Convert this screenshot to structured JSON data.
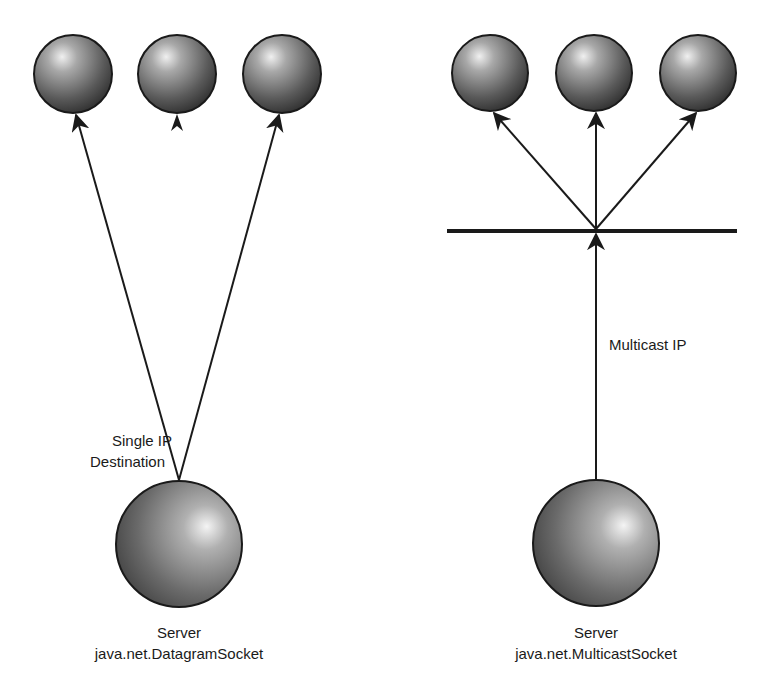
{
  "diagram": {
    "type": "network-comparison",
    "colors": {
      "background": "#ffffff",
      "stroke": "#1a1a1a",
      "sphere_light": "#f2f2f2",
      "sphere_mid": "#8a8a8a",
      "sphere_dark": "#3a3a3a"
    },
    "left": {
      "title": "Unicast",
      "clients": [
        {
          "id": "client-1",
          "cx": 73,
          "cy": 74,
          "r": 39,
          "arrow": "line"
        },
        {
          "id": "client-2",
          "cx": 177,
          "cy": 74,
          "r": 39,
          "arrow": "head-only"
        },
        {
          "id": "client-3",
          "cx": 282,
          "cy": 74,
          "r": 39,
          "arrow": "line"
        }
      ],
      "server": {
        "cx": 179,
        "cy": 544,
        "r": 63
      },
      "edge_label_line1": "Single IP",
      "edge_label_line2": "Destination",
      "server_label": "Server",
      "server_class": "java.net.DatagramSocket"
    },
    "right": {
      "title": "Multicast",
      "clients": [
        {
          "id": "client-4",
          "cx": 490,
          "cy": 73,
          "r": 38
        },
        {
          "id": "client-5",
          "cx": 594,
          "cy": 73,
          "r": 38
        },
        {
          "id": "client-6",
          "cx": 698,
          "cy": 73,
          "r": 38
        }
      ],
      "bus": {
        "x1": 447,
        "x2": 737,
        "y": 231
      },
      "server": {
        "cx": 596,
        "cy": 543,
        "r": 63
      },
      "edge_label": "Multicast IP",
      "server_label": "Server",
      "server_class": "java.net.MulticastSocket"
    }
  }
}
